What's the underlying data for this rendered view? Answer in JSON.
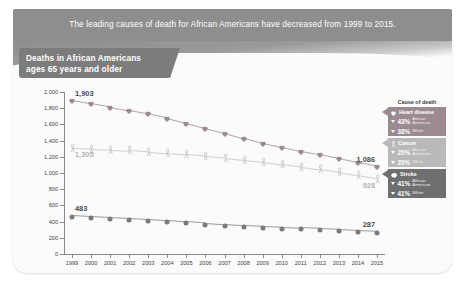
{
  "banner": {
    "text": "The leading causes of death for African Americans have decreased from 1999 to 2015."
  },
  "chart_panel": {
    "title_line1": "Deaths in African Americans",
    "title_line2": "ages 65 years and older"
  },
  "legend": {
    "title": "Cause of death",
    "items": [
      {
        "name": "Heart disease",
        "icon": "heart-icon",
        "color": "#9b8a90",
        "rows": [
          {
            "pct": "43%",
            "group": "African American",
            "direction": "down"
          },
          {
            "pct": "38%",
            "group": "White",
            "direction": "down"
          }
        ]
      },
      {
        "name": "Cancer",
        "icon": "ribbon-icon",
        "color": "#b9b9b9",
        "rows": [
          {
            "pct": "20%",
            "group": "African American",
            "direction": "down"
          },
          {
            "pct": "20%",
            "group": "White",
            "direction": "down"
          }
        ]
      },
      {
        "name": "Stroke",
        "icon": "brain-icon",
        "color": "#6f6f6f",
        "rows": [
          {
            "pct": "41%",
            "group": "African American",
            "direction": "down"
          },
          {
            "pct": "41%",
            "group": "White",
            "direction": "down"
          }
        ]
      }
    ]
  },
  "chart_data": {
    "type": "line",
    "title": "Deaths in African Americans ages 65 years and older",
    "xlabel": "",
    "ylabel": "Deaths per 100,000 people",
    "ylim": [
      0,
      2000
    ],
    "ytick_step": 200,
    "yticks": [
      "0",
      "200",
      "400",
      "600",
      "800",
      "1,000",
      "1,200",
      "1,400",
      "1,600",
      "1,800",
      "2,000"
    ],
    "grid": false,
    "legend_position": "right",
    "categories": [
      1999,
      2000,
      2001,
      2002,
      2003,
      2004,
      2005,
      2006,
      2007,
      2008,
      2009,
      2010,
      2011,
      2012,
      2013,
      2014,
      2015
    ],
    "series": [
      {
        "name": "Heart disease",
        "marker": "heart-icon",
        "color": "#9b8a90",
        "values": [
          1903,
          1862,
          1820,
          1775,
          1735,
          1680,
          1620,
          1560,
          1500,
          1430,
          1370,
          1320,
          1270,
          1230,
          1180,
          1130,
          1086
        ],
        "start_label": "1,903",
        "end_label": "1,086"
      },
      {
        "name": "Cancer",
        "marker": "ribbon-icon",
        "color": "#c0c0c0",
        "values": [
          1305,
          1300,
          1290,
          1280,
          1265,
          1250,
          1230,
          1210,
          1190,
          1165,
          1140,
          1110,
          1080,
          1050,
          1015,
          970,
          928
        ],
        "start_label": "1,305",
        "end_label": "928"
      },
      {
        "name": "Stroke",
        "marker": "circle-icon",
        "color": "#7a7a7a",
        "values": [
          483,
          470,
          458,
          447,
          434,
          418,
          402,
          388,
          372,
          358,
          348,
          338,
          328,
          318,
          308,
          296,
          287
        ],
        "start_label": "483",
        "end_label": "287"
      }
    ]
  }
}
